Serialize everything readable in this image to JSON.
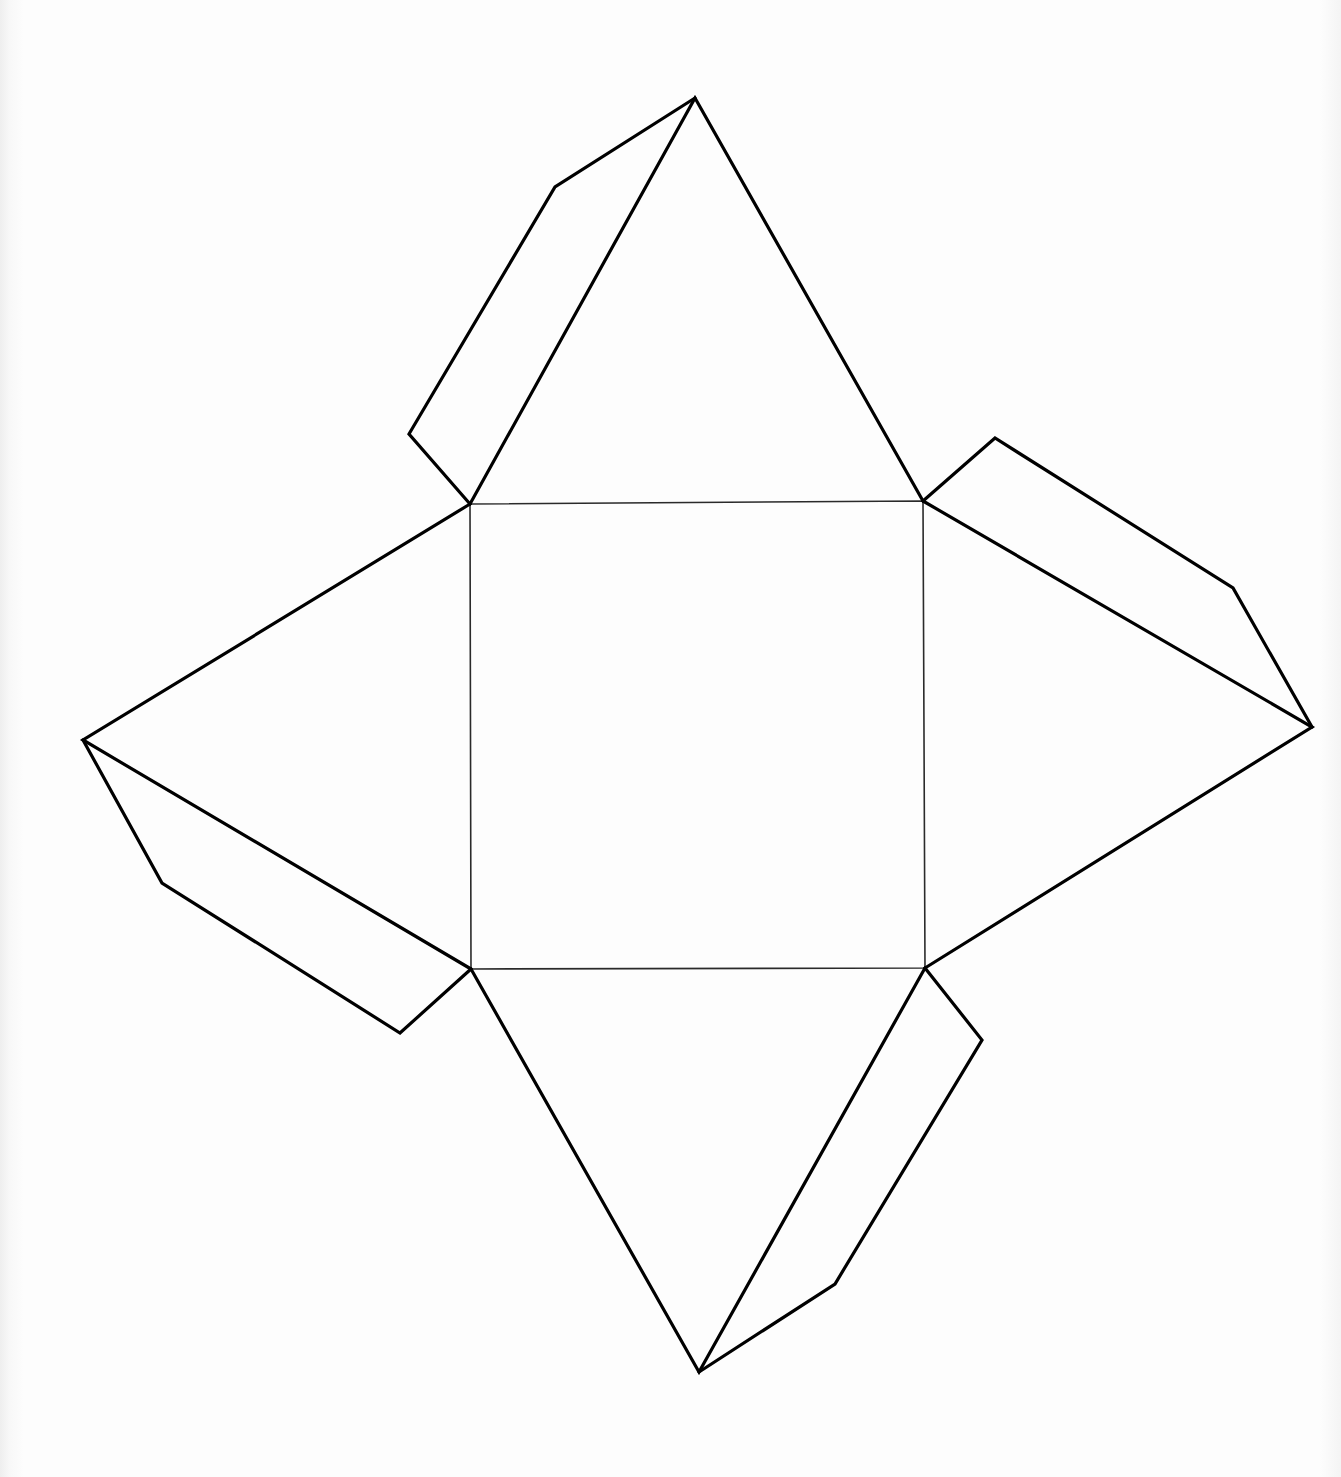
{
  "diagram": {
    "type": "net",
    "colors": {
      "outline": "#000000",
      "fold_line": "#2a2a2a",
      "paper": "#fdfdfd"
    },
    "base_square": {
      "points": [
        [
          470,
          504
        ],
        [
          923,
          501
        ],
        [
          925,
          968
        ],
        [
          471,
          969
        ]
      ]
    },
    "faces": {
      "top": {
        "points": [
          [
            470,
            504
          ],
          [
            695,
            98
          ],
          [
            923,
            501
          ]
        ]
      },
      "right": {
        "points": [
          [
            923,
            501
          ],
          [
            1312,
            727
          ],
          [
            925,
            968
          ]
        ]
      },
      "bottom": {
        "points": [
          [
            471,
            969
          ],
          [
            699,
            1372
          ],
          [
            925,
            968
          ]
        ]
      },
      "left": {
        "points": [
          [
            470,
            504
          ],
          [
            83,
            740
          ],
          [
            471,
            969
          ]
        ]
      }
    },
    "tabs": {
      "top_left_tab": {
        "points": [
          [
            470,
            504
          ],
          [
            409,
            434
          ],
          [
            555,
            187
          ],
          [
            695,
            98
          ]
        ]
      },
      "right_tab": {
        "points": [
          [
            923,
            501
          ],
          [
            995,
            438
          ],
          [
            1233,
            588
          ],
          [
            1312,
            727
          ]
        ]
      },
      "bottom_right_tab": {
        "points": [
          [
            925,
            968
          ],
          [
            982,
            1040
          ],
          [
            835,
            1284
          ],
          [
            699,
            1372
          ]
        ]
      },
      "left_tab": {
        "points": [
          [
            83,
            740
          ],
          [
            162,
            883
          ],
          [
            400,
            1033
          ],
          [
            471,
            969
          ]
        ]
      }
    }
  }
}
